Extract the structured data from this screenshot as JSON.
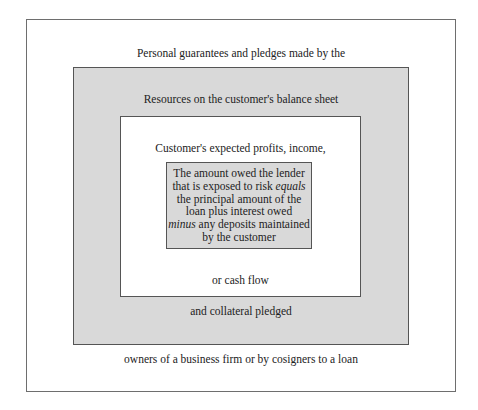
{
  "diagram": {
    "type": "nested-boxes",
    "colors": {
      "background": "#ffffff",
      "shaded": "#d9d9d9",
      "border": "#555555"
    },
    "layers": [
      {
        "id": "outer",
        "top_label": "Personal guarantees and pledges made by the",
        "bottom_label": "owners of a business firm or by cosigners to a loan"
      },
      {
        "id": "balance-sheet",
        "top_label": "Resources on the customer's balance sheet",
        "bottom_label": "and collateral pledged"
      },
      {
        "id": "income",
        "top_label": "Customer's expected profits, income,",
        "bottom_label": "or cash flow"
      },
      {
        "id": "core",
        "lines": [
          {
            "text": "The amount owed the lender"
          },
          {
            "pre": "that is exposed to risk ",
            "em": "equals"
          },
          {
            "text": "the principal amount of the"
          },
          {
            "text": "loan plus interest owed"
          },
          {
            "em": "minus",
            "post": " any deposits maintained"
          },
          {
            "text": "by the customer"
          }
        ]
      }
    ]
  }
}
